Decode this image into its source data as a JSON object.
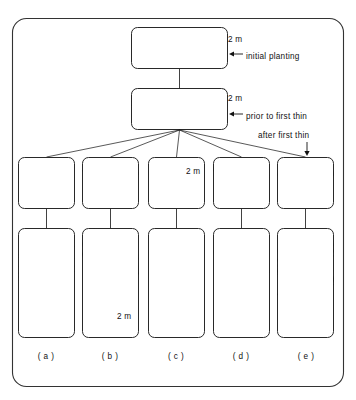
{
  "figure": {
    "kind": "silviculture-thinning-diagram",
    "outer_frame": {
      "stroke": "#333333",
      "fill": "#ffffff",
      "radius": 14
    },
    "ink_color": "#111111",
    "height_line_color": "#999999",
    "annotations": [
      {
        "name": "height-label-initial",
        "text": "2 m",
        "x": 228,
        "y": 36
      },
      {
        "name": "annotation-initial-planting",
        "text": "initial planting",
        "x": 246,
        "y": 53
      },
      {
        "name": "height-label-prior",
        "text": "2 m",
        "x": 228,
        "y": 95
      },
      {
        "name": "annotation-prior-first-thin",
        "text": "prior to first thin",
        "x": 246,
        "y": 113
      },
      {
        "name": "annotation-after-first-thin",
        "text": "after first thin",
        "x": 258,
        "y": 132
      },
      {
        "name": "height-label-middle-c",
        "text": "2 m",
        "x": 186,
        "y": 168
      },
      {
        "name": "height-label-bottom-b",
        "text": "2 m",
        "x": 117,
        "y": 313
      }
    ],
    "panel_letters": [
      {
        "name": "panel-letter-a",
        "text": "( a )",
        "cx": 46
      },
      {
        "name": "panel-letter-b",
        "text": "( b )",
        "cx": 110
      },
      {
        "name": "panel-letter-c",
        "text": "( c )",
        "cx": 176
      },
      {
        "name": "panel-letter-d",
        "text": "( d )",
        "cx": 241
      },
      {
        "name": "panel-letter-e",
        "text": "( e )",
        "cx": 306
      }
    ],
    "stages": [
      {
        "name": "stage-initial-planting",
        "label": "initial planting",
        "box": {
          "x": 131,
          "y": 27,
          "w": 97,
          "h": 42
        },
        "height_line_y_frac": 0.22,
        "vegetation": "seedlings-row",
        "density": 22,
        "tree_height_frac": 0.42
      },
      {
        "name": "stage-prior-to-first-thin",
        "label": "prior to first thin",
        "box": {
          "x": 131,
          "y": 88,
          "w": 97,
          "h": 42
        },
        "height_line_y_frac": 0.1,
        "vegetation": "dense-thicket",
        "density": 46,
        "tree_height_frac": 0.95
      }
    ],
    "middle_row": {
      "name": "after-first-thin-row",
      "label": "after first thin",
      "y": 157,
      "h": 52,
      "panels": [
        {
          "name": "middle-panel-a",
          "letter": "( a )",
          "x": 18,
          "w": 57,
          "style": "tall-sparse-poles",
          "density": 10,
          "height_frac": 0.88,
          "line_frac": 0.4
        },
        {
          "name": "middle-panel-b",
          "letter": "( b )",
          "x": 82,
          "w": 57,
          "style": "wide-spreading-few",
          "density": 4,
          "height_frac": 0.8,
          "line_frac": 0.42
        },
        {
          "name": "middle-panel-c",
          "letter": "( c )",
          "x": 148,
          "w": 57,
          "style": "short-grassy",
          "density": 12,
          "height_frac": 0.38,
          "line_frac": 0.34
        },
        {
          "name": "middle-panel-d",
          "letter": "( d )",
          "x": 213,
          "w": 57,
          "style": "mixed-medium",
          "density": 11,
          "height_frac": 0.72,
          "line_frac": 0.42
        },
        {
          "name": "middle-panel-e",
          "letter": "( e )",
          "x": 277,
          "w": 57,
          "style": "dense-medium",
          "density": 16,
          "height_frac": 0.82,
          "line_frac": 0.42
        }
      ]
    },
    "bottom_row": {
      "name": "final-stand-row",
      "y": 228,
      "h": 110,
      "panels": [
        {
          "name": "bottom-panel-a",
          "letter": "( a )",
          "x": 18,
          "w": 57,
          "style": "tall-straight-stems",
          "density": 9,
          "height_frac": 0.92,
          "line_frac": 0.72
        },
        {
          "name": "bottom-panel-b",
          "letter": "( b )",
          "x": 82,
          "w": 57,
          "style": "broad-branchy",
          "density": 3,
          "height_frac": 0.86,
          "line_frac": 0.78
        },
        {
          "name": "bottom-panel-c",
          "letter": "( c )",
          "x": 148,
          "w": 57,
          "style": "stunted-low",
          "density": 9,
          "height_frac": 0.26,
          "line_frac": 0.86
        },
        {
          "name": "bottom-panel-d",
          "letter": "( d )",
          "x": 213,
          "w": 57,
          "style": "two-tier",
          "density": 10,
          "height_frac": 0.78,
          "line_frac": 0.78
        },
        {
          "name": "bottom-panel-e",
          "letter": "( e )",
          "x": 277,
          "w": 57,
          "style": "dense-tall",
          "density": 12,
          "height_frac": 0.9,
          "line_frac": 0.8
        }
      ]
    }
  }
}
